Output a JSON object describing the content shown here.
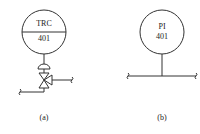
{
  "figure_a": {
    "instrument_tag_top": "TRC",
    "instrument_tag_bottom": "401",
    "caption": "(a)"
  },
  "figure_b": {
    "instrument_tag_top": "PI",
    "instrument_tag_bottom": "401",
    "caption": "(b)"
  }
}
